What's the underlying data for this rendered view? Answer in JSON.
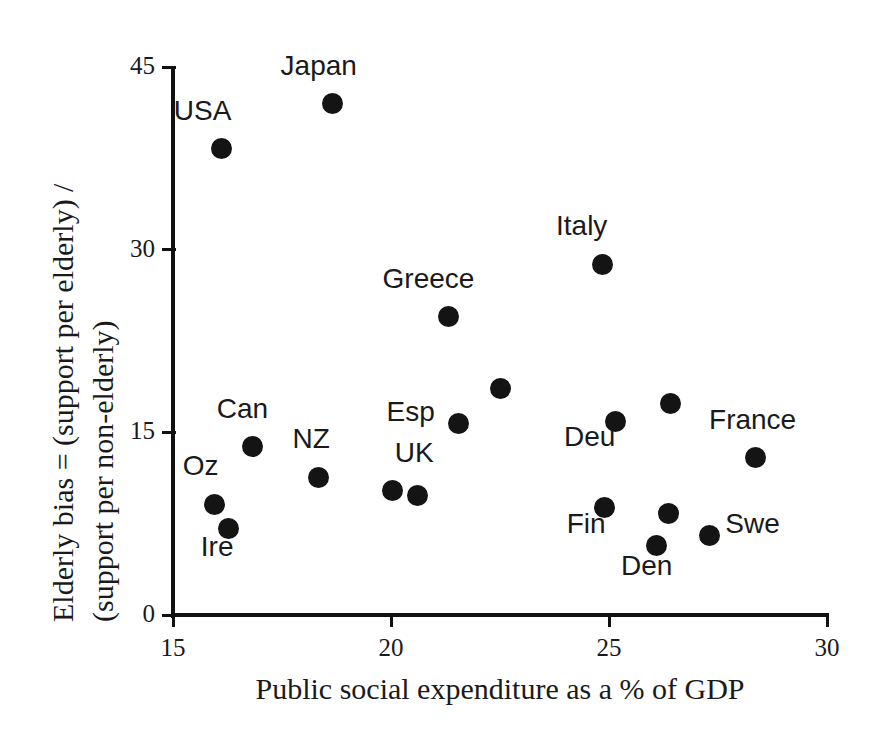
{
  "chart_data": {
    "type": "scatter",
    "title": "",
    "xlabel": "Public social expenditure as a % of GDP",
    "ylabel_line1": "Elderly bias = (support per elderly) /",
    "ylabel_line2": "(support per non-elderly)",
    "ylabel_full": "Elderly bias = (support per elderly) / (support per non-elderly)",
    "xlim": [
      15,
      30
    ],
    "ylim": [
      0,
      45
    ],
    "xticks": [
      "15",
      "20",
      "25",
      "30"
    ],
    "xtick_values": [
      15,
      20,
      25,
      30
    ],
    "yticks": [
      "0",
      "15",
      "30",
      "45"
    ],
    "ytick_values": [
      0,
      15,
      30,
      45
    ],
    "grid": false,
    "legend": "none",
    "marker_color": "#141414",
    "axis_color": "#111111",
    "points": [
      {
        "label": "USA",
        "x": 16.12,
        "y": 38.3,
        "label_dx": -48,
        "label_dy": -40
      },
      {
        "label": "Japan",
        "x": 18.66,
        "y": 42.0,
        "label_dx": -52,
        "label_dy": -40
      },
      {
        "label": "Italy",
        "x": 24.84,
        "y": 28.8,
        "label_dx": -46,
        "label_dy": -40
      },
      {
        "label": "Greece",
        "x": 21.32,
        "y": 24.5,
        "label_dx": -66,
        "label_dy": -40
      },
      {
        "label": "",
        "x": 22.51,
        "y": 18.6,
        "label_dx": 0,
        "label_dy": 0
      },
      {
        "label": "",
        "x": 26.4,
        "y": 17.4,
        "label_dx": 0,
        "label_dy": 0
      },
      {
        "label": "Deu",
        "x": 25.16,
        "y": 15.9,
        "label_dx": -52,
        "label_dy": 14
      },
      {
        "label": "Esp",
        "x": 21.55,
        "y": 15.7,
        "label_dx": -72,
        "label_dy": -14
      },
      {
        "label": "Can",
        "x": 16.83,
        "y": 13.8,
        "label_dx": -36,
        "label_dy": -40
      },
      {
        "label": "France",
        "x": 28.35,
        "y": 12.9,
        "label_dx": -46,
        "label_dy": -40
      },
      {
        "label": "NZ",
        "x": 18.34,
        "y": 11.3,
        "label_dx": -26,
        "label_dy": -40
      },
      {
        "label": "UK",
        "x": 20.04,
        "y": 10.2,
        "label_dx": 2,
        "label_dy": -40
      },
      {
        "label": "",
        "x": 20.61,
        "y": 9.85,
        "label_dx": 0,
        "label_dy": 0
      },
      {
        "label": "Oz",
        "x": 15.96,
        "y": 9.1,
        "label_dx": -32,
        "label_dy": -40
      },
      {
        "label": "Fin",
        "x": 24.9,
        "y": 8.8,
        "label_dx": -38,
        "label_dy": 14
      },
      {
        "label": "",
        "x": 26.36,
        "y": 8.3,
        "label_dx": 0,
        "label_dy": 0
      },
      {
        "label": "Ire",
        "x": 16.28,
        "y": 7.1,
        "label_dx": -28,
        "label_dy": 16
      },
      {
        "label": "Swe",
        "x": 27.3,
        "y": 6.5,
        "label_dx": 16,
        "label_dy": -14
      },
      {
        "label": "Den",
        "x": 26.1,
        "y": 5.7,
        "label_dx": -36,
        "label_dy": 18
      }
    ]
  },
  "caption_remnant": ""
}
